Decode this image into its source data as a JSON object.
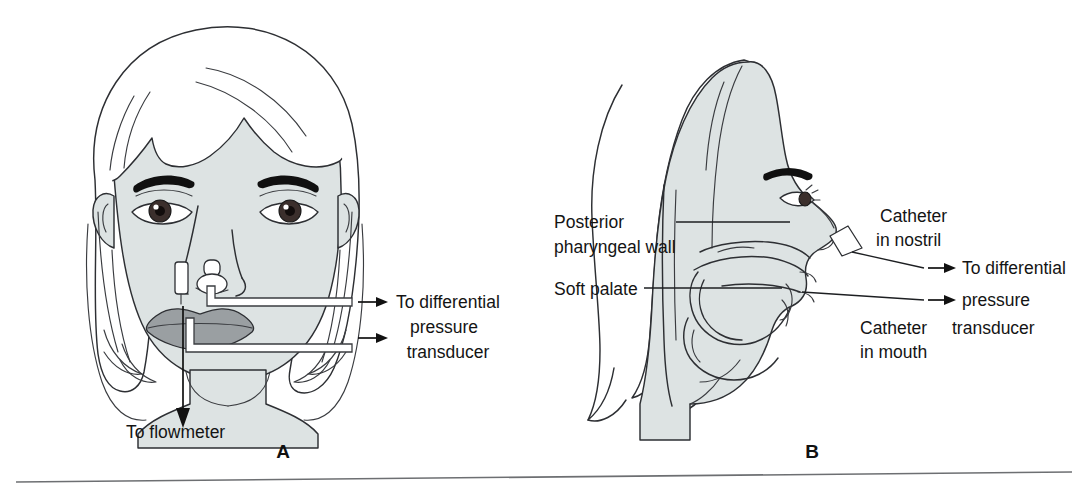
{
  "figure": {
    "kind": "medical-illustration",
    "background_color": "#ffffff",
    "ink_color": "#2d2f33",
    "skin_color": "#dde3e3",
    "lips_color": "#9a9fa2"
  },
  "panel_a": {
    "letter": "A",
    "view": "frontal face with nostril catheters and mouth catheter",
    "labels": {
      "transducer_line1": "To differential",
      "transducer_line2": "pressure",
      "transducer_line3": "transducer",
      "flowmeter": "To flowmeter"
    }
  },
  "panel_b": {
    "letter": "B",
    "view": "midsagittal profile of head showing catheter placement",
    "labels": {
      "posterior_line1": "Posterior",
      "posterior_line2": "pharyngeal wall",
      "soft_palate": "Soft palate",
      "catheter_nostril_line1": "Catheter",
      "catheter_nostril_line2": "in nostril",
      "catheter_mouth_line1": "Catheter",
      "catheter_mouth_line2": "in mouth",
      "transducer_line1": "To differential",
      "transducer_line2": "pressure",
      "transducer_line3": "transducer"
    }
  },
  "icons": {
    "arrow_right": "arrow-right-icon",
    "arrow_down": "arrow-down-icon"
  }
}
